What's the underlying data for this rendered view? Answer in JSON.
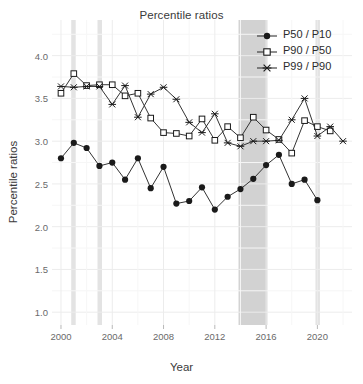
{
  "chart_data": {
    "type": "line",
    "title": "Percentile ratios",
    "xlabel": "Year",
    "ylabel": "Percentile ratios",
    "xlim": [
      1999.3,
      2022.7
    ],
    "ylim": [
      0.85,
      4.3
    ],
    "yticks": [
      "1.0",
      "1.5",
      "2.0",
      "2.5",
      "3.0",
      "3.5",
      "4.0"
    ],
    "ytick_values": [
      1.0,
      1.5,
      2.0,
      2.5,
      3.0,
      3.5,
      4.0
    ],
    "xticks": [
      "2000",
      "2004",
      "2008",
      "2012",
      "2016",
      "2020"
    ],
    "xtick_values": [
      2000,
      2004,
      2008,
      2012,
      2016,
      2020
    ],
    "grid": true,
    "legend_position": "top-right",
    "x": [
      2000,
      2001,
      2002,
      2003,
      2004,
      2005,
      2006,
      2007,
      2008,
      2009,
      2010,
      2011,
      2012,
      2013,
      2014,
      2015,
      2016,
      2017,
      2018,
      2019,
      2020,
      2021,
      2022
    ],
    "series": [
      {
        "name": "P50 / P10",
        "marker": "filled-circle",
        "values": [
          2.8,
          2.98,
          2.92,
          2.71,
          2.75,
          2.55,
          2.8,
          2.45,
          2.7,
          2.27,
          2.3,
          2.46,
          2.2,
          2.35,
          2.44,
          2.56,
          2.72,
          2.84,
          2.5,
          2.55,
          2.31,
          null,
          null
        ]
      },
      {
        "name": "P90 / P50",
        "marker": "open-square",
        "values": [
          3.56,
          3.79,
          3.65,
          3.66,
          3.66,
          3.53,
          3.56,
          3.27,
          3.1,
          3.09,
          3.06,
          3.26,
          3.01,
          3.17,
          3.04,
          3.28,
          3.13,
          3.02,
          2.86,
          3.24,
          3.17,
          3.12,
          null
        ]
      },
      {
        "name": "P99 / P90",
        "marker": "asterisk",
        "values": [
          3.64,
          3.63,
          3.64,
          3.64,
          3.43,
          3.65,
          3.28,
          3.55,
          3.63,
          3.49,
          3.22,
          3.1,
          3.32,
          2.98,
          2.94,
          3.0,
          3.0,
          3.01,
          3.25,
          3.5,
          3.06,
          3.17,
          3.0
        ]
      }
    ],
    "shaded_bands": [
      {
        "start": 2000.8,
        "end": 2001.15,
        "color": "#e3e3e3"
      },
      {
        "start": 2002.85,
        "end": 2003.2,
        "color": "#e3e3e3"
      },
      {
        "start": 2013.85,
        "end": 2016.1,
        "color": "#d2d2d2"
      },
      {
        "start": 2019.85,
        "end": 2020.2,
        "color": "#e3e3e3"
      }
    ],
    "series_color": "#333333",
    "grid_color": "#ececec",
    "background": "#ffffff"
  }
}
